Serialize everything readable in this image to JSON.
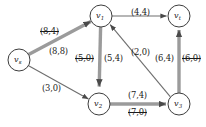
{
  "diagram": {
    "type": "flow-network",
    "title": "",
    "nodes": [
      {
        "id": "vs",
        "label": "v",
        "sub": "s",
        "cx": 19,
        "cy": 60,
        "r": 11
      },
      {
        "id": "v1",
        "label": "v",
        "sub": "1",
        "cx": 101,
        "cy": 16,
        "r": 11
      },
      {
        "id": "vt",
        "label": "v",
        "sub": "t",
        "cx": 179,
        "cy": 16,
        "r": 11
      },
      {
        "id": "v2",
        "label": "v",
        "sub": "2",
        "cx": 99,
        "cy": 104,
        "r": 11
      },
      {
        "id": "v3",
        "label": "v",
        "sub": "3",
        "cx": 179,
        "cy": 104,
        "r": 11
      }
    ],
    "edges": [
      {
        "id": "e_vs_v1_old",
        "from": "vs",
        "to": "v1",
        "label": "(8,4)",
        "struck": true,
        "highlighted": false
      },
      {
        "id": "e_vs_v1_new",
        "from": "vs",
        "to": "v1",
        "label": "(8,8)",
        "struck": false,
        "highlighted": true
      },
      {
        "id": "e_vs_v2",
        "from": "vs",
        "to": "v2",
        "label": "(3,0)",
        "struck": false,
        "highlighted": false
      },
      {
        "id": "e_v1_vt",
        "from": "v1",
        "to": "vt",
        "label": "(4,4)",
        "struck": false,
        "highlighted": false
      },
      {
        "id": "e_v1_v2_old",
        "from": "v1",
        "to": "v2",
        "label": "(5,0)",
        "struck": true,
        "highlighted": false
      },
      {
        "id": "e_v1_v2_new",
        "from": "v1",
        "to": "v2",
        "label": "(5,4)",
        "struck": false,
        "highlighted": true
      },
      {
        "id": "e_v3_v1",
        "from": "v3",
        "to": "v1",
        "label": "(2,0)",
        "struck": false,
        "highlighted": false
      },
      {
        "id": "e_v2_v3_new",
        "from": "v2",
        "to": "v3",
        "label": "(7,4)",
        "struck": false,
        "highlighted": true
      },
      {
        "id": "e_v2_v3_old",
        "from": "v2",
        "to": "v3",
        "label": "(7,0)",
        "struck": true,
        "highlighted": false
      },
      {
        "id": "e_v3_vt_new",
        "from": "v3",
        "to": "vt",
        "label": "(6,4)",
        "struck": false,
        "highlighted": true
      },
      {
        "id": "e_v3_vt_old",
        "from": "v3",
        "to": "vt",
        "label": "(6,0)",
        "struck": true,
        "highlighted": false
      }
    ],
    "edge_label_positions": [
      {
        "id": "e_vs_v1_old",
        "x": 40,
        "y": 27,
        "struck": true
      },
      {
        "id": "e_vs_v1_new",
        "x": 49,
        "y": 47,
        "struck": false
      },
      {
        "id": "e_vs_v2",
        "x": 42,
        "y": 84,
        "struck": false
      },
      {
        "id": "e_v1_vt",
        "x": 131,
        "y": 8,
        "struck": false
      },
      {
        "id": "e_v1_v2_old",
        "x": 75,
        "y": 54,
        "struck": true
      },
      {
        "id": "e_v1_v2_new",
        "x": 104,
        "y": 54,
        "struck": false
      },
      {
        "id": "e_v3_v1",
        "x": 131,
        "y": 48,
        "struck": false
      },
      {
        "id": "e_v2_v3_new",
        "x": 128,
        "y": 91,
        "struck": false
      },
      {
        "id": "e_v2_v3_old",
        "x": 128,
        "y": 108,
        "struck": true
      },
      {
        "id": "e_v3_vt_new",
        "x": 155,
        "y": 54,
        "struck": false
      },
      {
        "id": "e_v3_vt_old",
        "x": 182,
        "y": 54,
        "struck": true
      }
    ],
    "colors": {
      "node_stroke": "#3d3d3d",
      "edge_plain": "#6e6e6e",
      "edge_highlight": "#9b9b9b",
      "text": "#1a1a1a",
      "background": "#ffffff"
    }
  }
}
